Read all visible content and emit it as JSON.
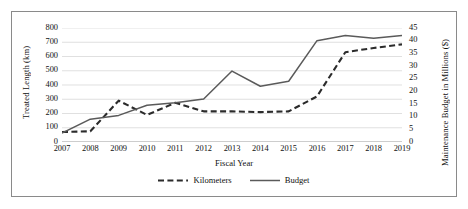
{
  "chart_data": {
    "type": "line",
    "title": "",
    "xlabel": "Fiscal Year",
    "ylabel": "Treated Length (km)",
    "y2label": "Maintenance Budget in Millions ($)",
    "grid": true,
    "legend_position": "bottom",
    "categories": [
      "2007",
      "2008",
      "2009",
      "2010",
      "2011",
      "2012",
      "2013",
      "2014",
      "2015",
      "2016",
      "2017",
      "2018",
      "2019"
    ],
    "ylim": [
      0,
      800
    ],
    "yticks": [
      0,
      100,
      200,
      300,
      400,
      500,
      600,
      700,
      800
    ],
    "y2lim": [
      0,
      45
    ],
    "y2ticks": [
      0,
      5,
      10,
      15,
      20,
      25,
      30,
      35,
      40,
      45
    ],
    "series": [
      {
        "name": "Kilometers",
        "axis": "left",
        "style": "dashed",
        "color": "#2b2b2b",
        "values": [
          70,
          75,
          290,
          190,
          275,
          215,
          215,
          210,
          215,
          320,
          630,
          660,
          685
        ]
      },
      {
        "name": "Budget",
        "axis": "right",
        "style": "solid",
        "color": "#5a5a5a",
        "values": [
          3.5,
          9.0,
          10.5,
          14.5,
          15.5,
          17.0,
          28.0,
          22.0,
          24.0,
          40.0,
          42.0,
          41.0,
          42.0
        ]
      }
    ]
  },
  "legend": {
    "items": [
      {
        "label": "Kilometers",
        "style": "dashed"
      },
      {
        "label": "Budget",
        "style": "solid"
      }
    ]
  }
}
